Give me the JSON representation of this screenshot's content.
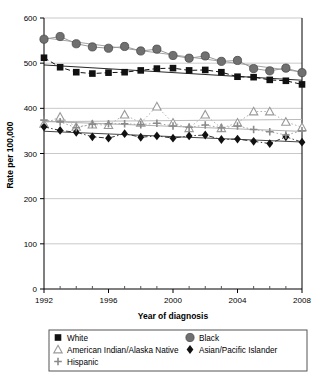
{
  "chart_data": {
    "type": "line",
    "title": "",
    "xlabel": "Year of diagnosis",
    "ylabel": "Rate per 100,000",
    "xlim": [
      1992,
      2008
    ],
    "ylim": [
      0,
      600
    ],
    "ytick_labels": [
      "0",
      "100",
      "200",
      "300",
      "400",
      "500",
      "600"
    ],
    "yticks": [
      0,
      100,
      200,
      300,
      400,
      500,
      600
    ],
    "xtick_labels": [
      "1992",
      "1996",
      "2000",
      "2004",
      "2008"
    ],
    "xticks": [
      1992,
      1996,
      2000,
      2004,
      2008
    ],
    "x_minor_ticks": [
      1993,
      1994,
      1995,
      1997,
      1998,
      1999,
      2001,
      2002,
      2003,
      2005,
      2006,
      2007
    ],
    "grid": "horizontal",
    "legend_position": "below",
    "x": [
      1992,
      1993,
      1994,
      1995,
      1996,
      1997,
      1998,
      1999,
      2000,
      2001,
      2002,
      2003,
      2004,
      2005,
      2006,
      2007,
      2008
    ],
    "series": [
      {
        "name": "White",
        "marker": "square",
        "marker_color": "#111111",
        "line_color": "#111111",
        "line_style": "dashed",
        "trend_color": "#111111",
        "values": [
          512,
          491,
          480,
          477,
          479,
          480,
          484,
          488,
          489,
          484,
          485,
          480,
          470,
          469,
          463,
          461,
          453
        ]
      },
      {
        "name": "Black",
        "marker": "circle",
        "marker_color": "#707070",
        "line_color": "#999999",
        "line_style": "solid",
        "trend_color": "#999999",
        "values": [
          553,
          559,
          543,
          536,
          533,
          537,
          527,
          531,
          517,
          511,
          516,
          504,
          506,
          488,
          483,
          489,
          479
        ]
      },
      {
        "name": "American Indian/Alaska Native",
        "marker": "triangle",
        "marker_color": "#9a9a9a",
        "line_color": "#b5b5b5",
        "line_style": "dotted",
        "trend_color": "#b5b5b5",
        "values": [
          366,
          381,
          359,
          364,
          363,
          386,
          368,
          404,
          368,
          356,
          386,
          356,
          368,
          393,
          393,
          370,
          358
        ]
      },
      {
        "name": "Asian/Pacific Islander",
        "marker": "diamond",
        "marker_color": "#111111",
        "line_color": "#333333",
        "line_style": "dashdot",
        "trend_color": "#333333",
        "values": [
          359,
          351,
          347,
          337,
          334,
          344,
          336,
          339,
          334,
          339,
          341,
          331,
          332,
          327,
          322,
          337,
          325
        ]
      },
      {
        "name": "Hispanic",
        "marker": "plus",
        "marker_color": "#8a8a8a",
        "line_color": "#a8a8a8",
        "line_style": "dotted",
        "trend_color": "#a8a8a8",
        "values": [
          374,
          370,
          357,
          365,
          366,
          366,
          364,
          367,
          361,
          358,
          363,
          357,
          361,
          353,
          348,
          341,
          350
        ]
      }
    ]
  },
  "legend": {
    "entries": [
      {
        "label": "White",
        "marker": "square"
      },
      {
        "label": "Black",
        "marker": "circle"
      },
      {
        "label": "American Indian/Alaska Native",
        "marker": "triangle"
      },
      {
        "label": "Asian/Pacific Islander",
        "marker": "diamond"
      },
      {
        "label": "Hispanic",
        "marker": "plus"
      }
    ]
  }
}
